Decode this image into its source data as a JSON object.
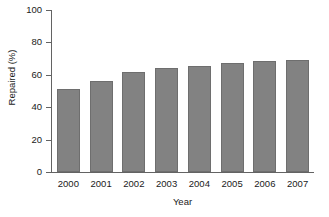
{
  "chart_data": {
    "type": "bar",
    "title": "",
    "xlabel": "Year",
    "ylabel": "Repaired (%)",
    "categories": [
      "2000",
      "2001",
      "2002",
      "2003",
      "2004",
      "2005",
      "2006",
      "2007"
    ],
    "values": [
      51.5,
      56.0,
      61.5,
      64.5,
      65.5,
      67.5,
      68.5,
      69.0
    ],
    "ylim": [
      0,
      100
    ],
    "yticks": [
      0,
      20,
      40,
      60,
      80,
      100
    ],
    "ytick_labels": [
      "0",
      "20",
      "40",
      "60",
      "80",
      "100"
    ],
    "grid": false,
    "legend": false,
    "bar_color": "#828282",
    "bar_edge_color": "#6e6e6e",
    "axis_color": "#636363",
    "text_color": "#1a1a1a",
    "background": "#ffffff"
  },
  "figure": {
    "caption_sliver": ""
  }
}
